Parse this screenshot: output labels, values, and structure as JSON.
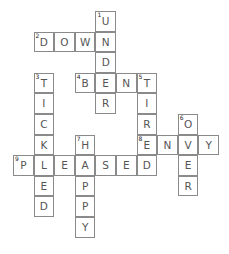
{
  "puzzle": {
    "type": "crossword",
    "entries": [
      {
        "number": 1,
        "direction": "down",
        "answer": "UNDER",
        "col": 4,
        "row": 0
      },
      {
        "number": 2,
        "direction": "across",
        "answer": "DOWN",
        "col": 1,
        "row": 1
      },
      {
        "number": 3,
        "direction": "down",
        "answer": "TICKLED",
        "col": 1,
        "row": 3
      },
      {
        "number": 4,
        "direction": "across",
        "answer": "BENT",
        "col": 3,
        "row": 3
      },
      {
        "number": 5,
        "direction": "down",
        "answer": "TIRED",
        "col": 6,
        "row": 3
      },
      {
        "number": 6,
        "direction": "down",
        "answer": "OVER",
        "col": 8,
        "row": 5
      },
      {
        "number": 7,
        "direction": "down",
        "answer": "HAPPY",
        "col": 3,
        "row": 6
      },
      {
        "number": 8,
        "direction": "across",
        "answer": "ENVY",
        "col": 6,
        "row": 6
      },
      {
        "number": 9,
        "direction": "across",
        "answer": "PLEASED",
        "col": 0,
        "row": 7
      }
    ]
  }
}
